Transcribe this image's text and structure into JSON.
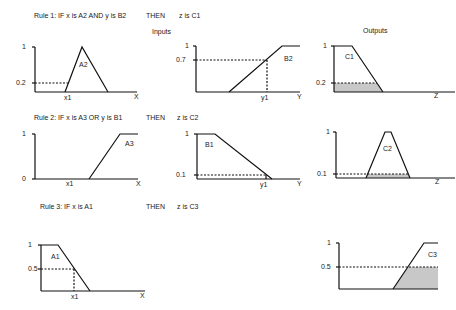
{
  "section_labels": {
    "inputs": "Inputs",
    "outputs": "Outputs"
  },
  "rules": [
    {
      "condition": "Rule 1: IF x is A2  AND  y is B2",
      "then": "THEN",
      "consequent": "z is C1",
      "x_set": {
        "name": "A2",
        "axis": "X",
        "input_label": "x1",
        "ticks": [
          "1",
          "0.2"
        ]
      },
      "y_set": {
        "name": "B2",
        "axis": "Y",
        "input_label": "y1",
        "ticks": [
          "1",
          "0.7"
        ]
      },
      "z_set": {
        "name": "C1",
        "axis": "Z",
        "ticks": [
          "1",
          "0.2"
        ]
      }
    },
    {
      "condition": "Rule 2: IF x is A3   OR   y is B1",
      "then": "THEN",
      "consequent": "z is C2",
      "x_set": {
        "name": "A3",
        "axis": "X",
        "input_label": "x1",
        "ticks": [
          "1",
          "0"
        ]
      },
      "y_set": {
        "name": "B1",
        "axis": "Y",
        "input_label": "y1",
        "ticks": [
          "1",
          "0.1"
        ]
      },
      "z_set": {
        "name": "C2",
        "axis": "Z",
        "ticks": [
          "1",
          "0.1"
        ]
      }
    },
    {
      "condition": "Rule 3: IF x is A1",
      "then": "THEN",
      "consequent": "z is C3",
      "x_set": {
        "name": "A1",
        "axis": "X",
        "input_label": "x1",
        "ticks": [
          "1",
          "0.5"
        ]
      },
      "z_set": {
        "name": "C3",
        "ticks": [
          "1",
          "0.5"
        ]
      }
    }
  ],
  "colors": {
    "line": "#111111",
    "shade": "#c8c8c8"
  }
}
